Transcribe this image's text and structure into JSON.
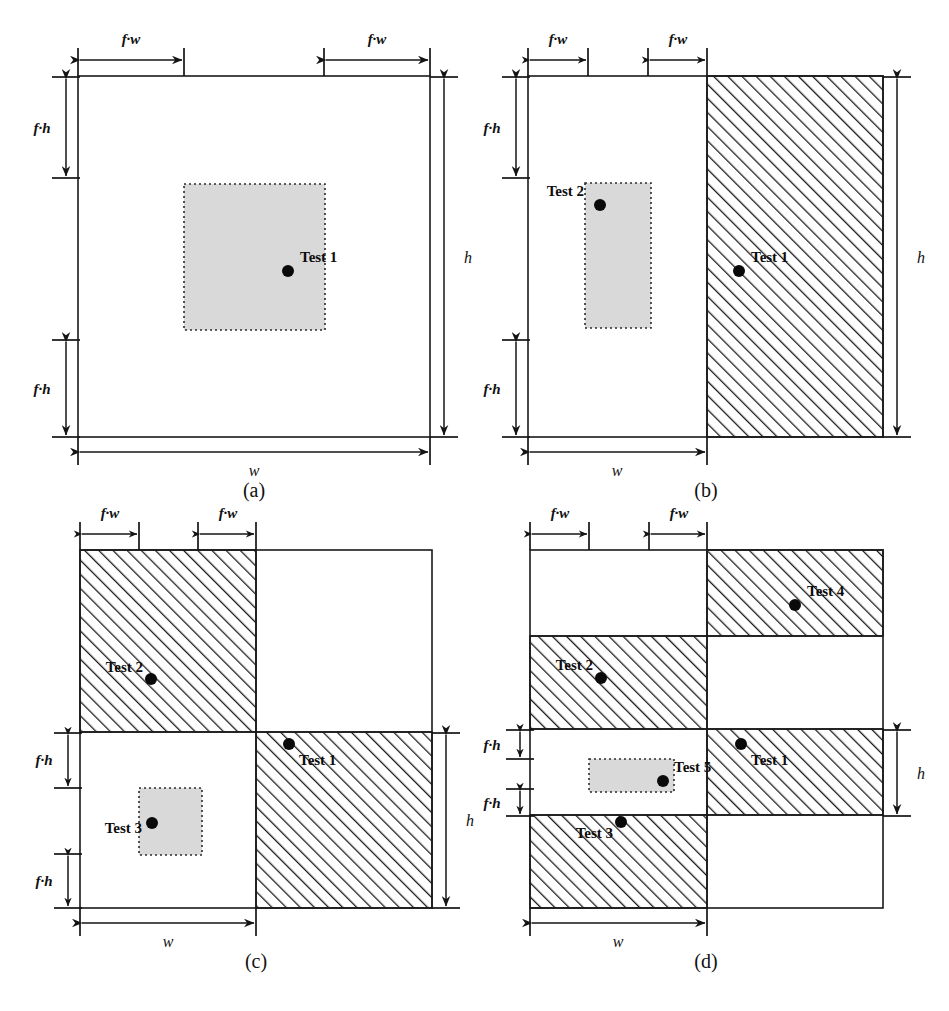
{
  "figure": {
    "type": "technical-diagram",
    "dot_legend": "filled-circle-marker"
  },
  "labels": {
    "fw": "f·w",
    "fh": "f·h",
    "w": "w",
    "h": "h"
  },
  "panels": [
    {
      "id": "a",
      "caption": "(a)",
      "dim_labels": {
        "fw_left": "f·w",
        "fw_right": "f·w",
        "fh_top": "f·h",
        "fh_bottom": "f·h",
        "w": "w",
        "h": "h"
      },
      "hatched_regions": [],
      "gray_boxes": [
        {
          "name": "overlap-region-1"
        }
      ],
      "tests": [
        {
          "label": "Test 1"
        }
      ]
    },
    {
      "id": "b",
      "caption": "(b)",
      "dim_labels": {
        "fw_left": "f·w",
        "fw_right": "f·w",
        "fh_top": "f·h",
        "fh_bottom": "f·h",
        "w": "w",
        "h": "h"
      },
      "hatched_regions": [
        {
          "name": "hatched-right-column"
        }
      ],
      "gray_boxes": [
        {
          "name": "overlap-region-2"
        }
      ],
      "tests": [
        {
          "label": "Test 2"
        },
        {
          "label": "Test 1"
        }
      ]
    },
    {
      "id": "c",
      "caption": "(c)",
      "dim_labels": {
        "fw_left": "f·w",
        "fw_right": "f·w",
        "fh_top": "f·h",
        "fh_bottom": "f·h",
        "w": "w",
        "h": "h"
      },
      "hatched_regions": [
        {
          "name": "hatched-top-left"
        },
        {
          "name": "hatched-bottom-right"
        }
      ],
      "gray_boxes": [
        {
          "name": "overlap-region-3"
        }
      ],
      "tests": [
        {
          "label": "Test 2"
        },
        {
          "label": "Test 1"
        },
        {
          "label": "Test 3"
        }
      ]
    },
    {
      "id": "d",
      "caption": "(d)",
      "dim_labels": {
        "fw_left": "f·w",
        "fw_right": "f·w",
        "fh_top": "f·h",
        "fh_bottom": "f·h",
        "w": "w",
        "h": "h"
      },
      "hatched_regions": [
        {
          "name": "hatched-band1-right"
        },
        {
          "name": "hatched-band2-left"
        },
        {
          "name": "hatched-band3-right"
        },
        {
          "name": "hatched-band4-left"
        }
      ],
      "gray_boxes": [
        {
          "name": "overlap-region-5"
        }
      ],
      "tests": [
        {
          "label": "Test 4"
        },
        {
          "label": "Test 2"
        },
        {
          "label": "Test 1"
        },
        {
          "label": "Test 5"
        },
        {
          "label": "Test 3"
        }
      ]
    }
  ],
  "colors": {
    "gray_fill": "#d9d9d9",
    "stroke": "#1a1a1a",
    "dot": "#0a0a0a",
    "background": "#ffffff"
  }
}
